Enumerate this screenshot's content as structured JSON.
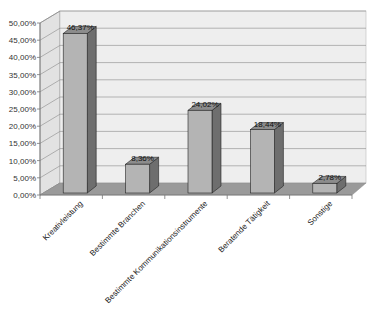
{
  "chart_data": {
    "type": "bar",
    "style": "3d-column",
    "title": "",
    "xlabel": "",
    "ylabel": "",
    "categories": [
      "Kreativleistung",
      "Bestimmte Branchen",
      "Bestimmte Kommunikationsinstrumente",
      "Beratende Tätigkeit",
      "Sonstige"
    ],
    "values": [
      46.37,
      8.36,
      24.02,
      18.44,
      2.78
    ],
    "data_labels": [
      "46,37%",
      "8,36%",
      "24,02%",
      "18,44%",
      "2,78%"
    ],
    "ylim": [
      0,
      50
    ],
    "yticks": [
      "0,00%",
      "5,00%",
      "10,00%",
      "15,00%",
      "20,00%",
      "25,00%",
      "30,00%",
      "35,00%",
      "40,00%",
      "45,00%",
      "50,00%"
    ],
    "grid": true,
    "legend": null
  },
  "colors": {
    "bar_front": "#b4b4b4",
    "bar_side": "#6e6e6e",
    "bar_top": "#8c8c8c",
    "wall": "#eeeeee",
    "floor": "#9a9a9a",
    "gridline": "#8a8a8a",
    "axis": "#777777"
  }
}
